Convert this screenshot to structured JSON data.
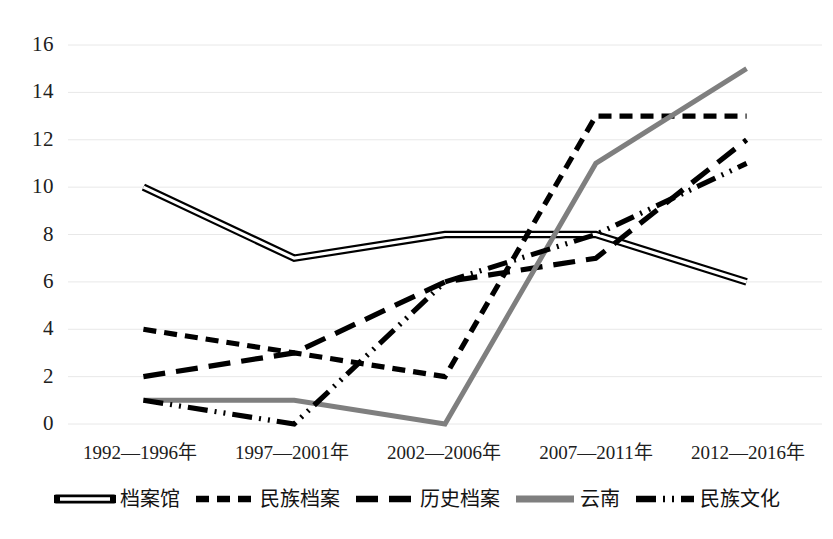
{
  "chart_data": {
    "type": "line",
    "title": "",
    "xlabel": "",
    "ylabel": "",
    "ylim": [
      0,
      16
    ],
    "yticks": [
      0,
      2,
      4,
      6,
      8,
      10,
      12,
      14,
      16
    ],
    "grid": true,
    "legend_position": "bottom",
    "categories": [
      "1992—1996年",
      "1997—2001年",
      "2002—2006年",
      "2007—2011年",
      "2012—2016年"
    ],
    "series": [
      {
        "name": "档案馆",
        "values": [
          10,
          7,
          8,
          8,
          6
        ],
        "style": "double-solid",
        "color": "#000000"
      },
      {
        "name": "民族档案",
        "values": [
          4,
          3,
          2,
          13,
          13
        ],
        "style": "short-dash",
        "color": "#000000"
      },
      {
        "name": "历史档案",
        "values": [
          2,
          3,
          6,
          7,
          12
        ],
        "style": "long-dash",
        "color": "#000000"
      },
      {
        "name": "云南",
        "values": [
          1,
          1,
          0,
          11,
          15
        ],
        "style": "thick-solid",
        "color": "#7f7f7f"
      },
      {
        "name": "民族文化",
        "values": [
          1,
          0,
          6,
          8,
          11
        ],
        "style": "dash-dot-dot",
        "color": "#000000"
      }
    ]
  },
  "axis": {
    "y_tick_labels": [
      "16",
      "14",
      "12",
      "10",
      "8",
      "6",
      "4",
      "2",
      "0"
    ],
    "x_tick_labels": [
      "1992—1996年",
      "1997—2001年",
      "2002—2006年",
      "2007—2011年",
      "2012—2016年"
    ]
  },
  "legend": {
    "items": [
      {
        "label": "档案馆",
        "swatch": "double-solid-swatch"
      },
      {
        "label": "民族档案",
        "swatch": "short-dash-swatch"
      },
      {
        "label": "历史档案",
        "swatch": "long-dash-swatch"
      },
      {
        "label": "云南",
        "swatch": "thick-solid-swatch"
      },
      {
        "label": "民族文化",
        "swatch": "dash-dot-dot-swatch"
      }
    ]
  },
  "colors": {
    "gridline": "#e8e8e8",
    "ink": "#000000",
    "gray_series": "#7f7f7f",
    "background": "#ffffff"
  }
}
